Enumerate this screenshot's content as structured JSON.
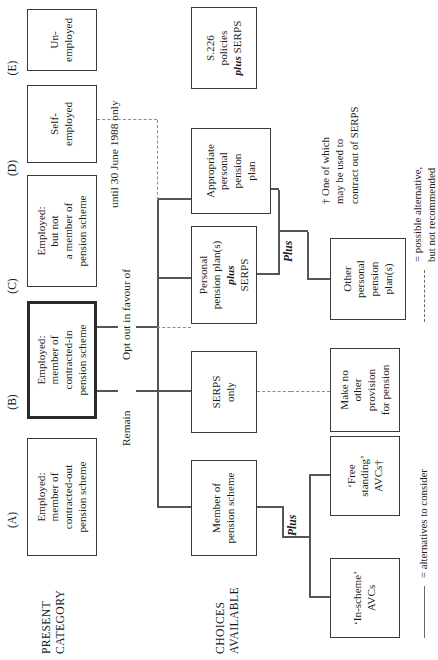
{
  "diagram": {
    "row_labels": [
      {
        "id": "present-category",
        "text": "PRESENT\nCATEGORY"
      },
      {
        "id": "choices-available",
        "text": "CHOICES\nAVAILABLE"
      }
    ],
    "column_headers": [
      {
        "id": "A",
        "label": "(A)"
      },
      {
        "id": "B",
        "label": "(B)"
      },
      {
        "id": "C",
        "label": "(C)"
      },
      {
        "id": "D",
        "label": "(D)"
      },
      {
        "id": "E",
        "label": "(E)"
      }
    ],
    "category_boxes": [
      {
        "id": "cat-a",
        "text": "Employed:\nmember of\ncontracted-out\npension scheme",
        "bold": false
      },
      {
        "id": "cat-b",
        "text": "Employed:\nmember of\ncontracted-in\npension scheme",
        "bold": true
      },
      {
        "id": "cat-c",
        "text": "Employed:\nbut not\na member of\npension scheme",
        "bold": false
      },
      {
        "id": "cat-d",
        "text": "Self-\nemployed",
        "bold": false
      },
      {
        "id": "cat-e",
        "text": "Un-\nemployed",
        "bold": false
      }
    ],
    "choice_boxes": [
      {
        "id": "choice-member",
        "text": "Member of\npension scheme"
      },
      {
        "id": "choice-serps-only",
        "text": "SERPS\nonly"
      },
      {
        "id": "choice-ppp-plus-serps",
        "line1": "Personal",
        "line2": "pension plan(s)",
        "emph": "plus",
        "line3": "SERPS"
      },
      {
        "id": "choice-appropriate-ppp",
        "text": "Appropriate\npersonal\npension\nplan"
      },
      {
        "id": "choice-s226",
        "line1": "S.226",
        "line2": "policies",
        "emph": "plus",
        "line3": " SERPS"
      }
    ],
    "secondary_boxes": [
      {
        "id": "sec-in-scheme-avcs",
        "text": "‘In-scheme’\nAVCs"
      },
      {
        "id": "sec-free-standing-avcs",
        "text": "‘Free\nstanding’\nAVCs†"
      },
      {
        "id": "sec-no-provision",
        "text": "Make no\nother\nprovision\nfor pension"
      },
      {
        "id": "sec-other-ppp",
        "text": "Other\npersonal\npension\nplan(s)"
      }
    ],
    "edge_labels": [
      {
        "id": "edge-remain",
        "text": "Remain"
      },
      {
        "id": "edge-opt-out",
        "text": "Opt out in favour of"
      },
      {
        "id": "edge-until-1988",
        "text": "until 30 June 1988 only"
      }
    ],
    "plus_labels": [
      {
        "id": "plus-avcs",
        "text": "Plus"
      },
      {
        "id": "plus-other-ppp",
        "text": "Plus"
      }
    ],
    "footnote": {
      "id": "footnote-dagger",
      "text": "† One of which\n   may be used to\n   contract out of SERPS"
    },
    "legend": [
      {
        "id": "legend-solid",
        "style": "solid",
        "text": "= alternatives to consider"
      },
      {
        "id": "legend-dashed",
        "style": "dashed",
        "text": "= possible alternative,\n   but not recommended"
      }
    ]
  }
}
